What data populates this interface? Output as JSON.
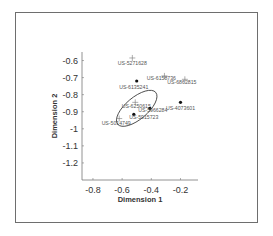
{
  "chart_data": {
    "type": "scatter",
    "title": "",
    "xlabel": "Dimension 1",
    "ylabel": "Dimension 2",
    "xlim": [
      -0.875,
      -0.08
    ],
    "ylim": [
      -1.3,
      -0.55
    ],
    "xticks": [
      -0.8,
      -0.6,
      -0.4,
      -0.2
    ],
    "xtick_labels": [
      "-0.8",
      "-0.6",
      "-0.4",
      "-0.2"
    ],
    "yticks": [
      -0.6,
      -0.7,
      -0.8,
      -0.9,
      -1.0,
      -1.1,
      -1.2
    ],
    "ytick_labels": [
      "-0.6",
      "-0.7",
      "-0.8",
      "-0.9",
      "-1",
      "-1.1",
      "-1.2"
    ],
    "grid": false,
    "points": [
      {
        "label": "US-5271628",
        "x": -0.53,
        "y": -0.585,
        "marker": "plus"
      },
      {
        "label": "US-6135241",
        "x": -0.5,
        "y": -0.72,
        "marker": "dot"
      },
      {
        "label": "US-6158736",
        "x": -0.31,
        "y": -0.69,
        "marker": "plus"
      },
      {
        "label": "US-6862815",
        "x": -0.17,
        "y": -0.71,
        "marker": "plus"
      },
      {
        "label": "US-4073601",
        "x": -0.2,
        "y": -0.845,
        "marker": "dot"
      },
      {
        "label": "US-6250615",
        "x": -0.51,
        "y": -0.845,
        "marker": "plus"
      },
      {
        "label": "US-5966284",
        "x": -0.41,
        "y": -0.88,
        "marker": "dot"
      },
      {
        "label": "US-5915723",
        "x": -0.52,
        "y": -0.915,
        "marker": "dot"
      },
      {
        "label": "US-5014749",
        "x": -0.62,
        "y": -0.94,
        "marker": "plus"
      }
    ],
    "annotations": [
      {
        "type": "ellipse",
        "center": [
          -0.5,
          -0.88
        ],
        "semi_axes": [
          0.17,
          0.1
        ],
        "rotation_deg": -40,
        "note": "cluster boundary"
      }
    ]
  }
}
